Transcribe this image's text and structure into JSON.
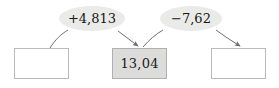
{
  "diagram": {
    "type": "arithmetic-flow",
    "nodes": [
      {
        "id": "left",
        "value": "",
        "filled": false
      },
      {
        "id": "middle",
        "value": "13,04",
        "filled": true
      },
      {
        "id": "right",
        "value": "",
        "filled": false
      }
    ],
    "operations": [
      {
        "id": "add",
        "label": "+4,813",
        "sign": "+",
        "magnitude": "4,813"
      },
      {
        "id": "sub",
        "label": "−7,62",
        "sign": "−",
        "magnitude": "7,62"
      }
    ],
    "arrows": [
      {
        "id": "left-to-add",
        "from": "left",
        "to": "add",
        "arrowhead": false
      },
      {
        "id": "add-to-middle",
        "from": "add",
        "to": "middle",
        "arrowhead": true
      },
      {
        "id": "middle-to-sub",
        "from": "middle",
        "to": "sub",
        "arrowhead": false
      },
      {
        "id": "sub-to-right",
        "from": "sub",
        "to": "right",
        "arrowhead": true
      }
    ],
    "colors": {
      "background": "#ffffff",
      "box_border": "#b9b9b7",
      "box_fill_empty": "#ffffff",
      "box_fill_highlight": "#dcdcda",
      "label_fill": "#eaeae8",
      "text": "#1b1b1b",
      "arrow": "#6f6f6d"
    }
  }
}
